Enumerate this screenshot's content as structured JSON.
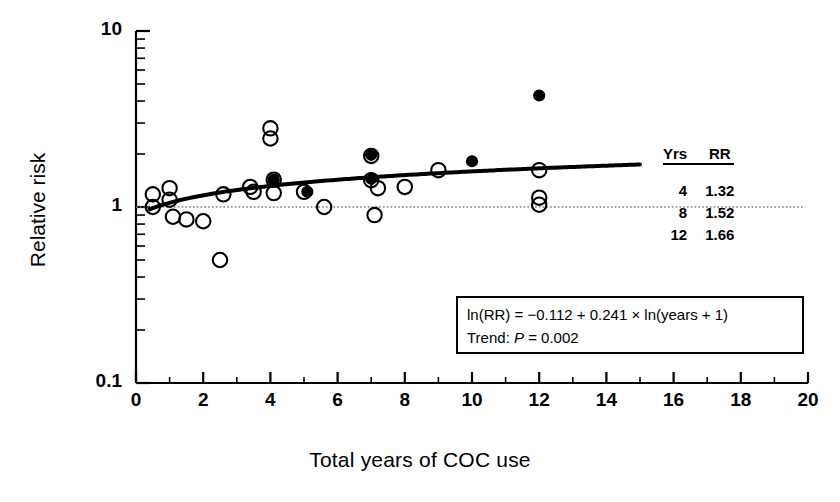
{
  "figure": {
    "title": "",
    "background": "#ffffff",
    "foreground": "#000000"
  },
  "axes": {
    "x_label": "Total years of COC use",
    "y_label": "Relative risk",
    "x_ticks": [
      "0",
      "2",
      "4",
      "6",
      "8",
      "10",
      "12",
      "14",
      "16",
      "18",
      "20"
    ],
    "y_ticks": [
      "10",
      "1",
      "0.1"
    ]
  },
  "legend": {
    "header_yrs": "Yrs",
    "header_rr": "RR",
    "rows": [
      {
        "yrs": "4",
        "rr": "1.32"
      },
      {
        "yrs": "8",
        "rr": "1.52"
      },
      {
        "yrs": "12",
        "rr": "1.66"
      }
    ]
  },
  "equation_box": {
    "line1_pre": "ln(RR) = −0.112 + 0.241 × ln(years + 1)",
    "line2_pre": "Trend: ",
    "line2_italic": "P",
    "line2_post": " = 0.002"
  },
  "chart_data": {
    "type": "scatter",
    "title": "",
    "xlabel": "Total years of COC use",
    "ylabel": "Relative risk",
    "xlim": [
      0,
      20
    ],
    "ylim": [
      0.1,
      10
    ],
    "yscale": "log",
    "grid": false,
    "legend_position": "right",
    "reference_line": {
      "y": 1.0,
      "style": "dotted",
      "color": "#808080"
    },
    "fit_curve": {
      "label": "ln(RR) = −0.112 + 0.241 × ln(years + 1)",
      "intercept": -0.112,
      "slope": 0.241,
      "form": "log",
      "x_range": [
        0.4,
        15.0
      ],
      "style": "solid",
      "width": 4,
      "color": "#000000",
      "p_trend": 0.002,
      "predicted": [
        {
          "years": 4,
          "rr": 1.32
        },
        {
          "years": 8,
          "rr": 1.52
        },
        {
          "years": 12,
          "rr": 1.66
        }
      ]
    },
    "series": [
      {
        "name": "open-circles",
        "marker": "open circle",
        "points": [
          {
            "x": 0.5,
            "y": 1.0
          },
          {
            "x": 0.5,
            "y": 1.18
          },
          {
            "x": 1.0,
            "y": 1.28
          },
          {
            "x": 1.0,
            "y": 1.1
          },
          {
            "x": 1.1,
            "y": 0.88
          },
          {
            "x": 1.5,
            "y": 0.85
          },
          {
            "x": 2.0,
            "y": 0.83
          },
          {
            "x": 2.5,
            "y": 0.5
          },
          {
            "x": 2.6,
            "y": 1.18
          },
          {
            "x": 3.4,
            "y": 1.3
          },
          {
            "x": 3.5,
            "y": 1.22
          },
          {
            "x": 4.0,
            "y": 2.8
          },
          {
            "x": 4.0,
            "y": 2.45
          },
          {
            "x": 4.1,
            "y": 1.43
          },
          {
            "x": 4.1,
            "y": 1.2
          },
          {
            "x": 5.0,
            "y": 1.22
          },
          {
            "x": 5.6,
            "y": 1.0
          },
          {
            "x": 7.0,
            "y": 1.95
          },
          {
            "x": 7.0,
            "y": 1.42
          },
          {
            "x": 7.2,
            "y": 1.28
          },
          {
            "x": 7.1,
            "y": 0.9
          },
          {
            "x": 8.0,
            "y": 1.3
          },
          {
            "x": 9.0,
            "y": 1.62
          },
          {
            "x": 12.0,
            "y": 1.62
          },
          {
            "x": 12.0,
            "y": 1.13
          },
          {
            "x": 12.0,
            "y": 1.03
          }
        ]
      },
      {
        "name": "filled-circles",
        "marker": "filled circle",
        "points": [
          {
            "x": 4.1,
            "y": 1.43
          },
          {
            "x": 5.1,
            "y": 1.22
          },
          {
            "x": 7.0,
            "y": 1.98
          },
          {
            "x": 7.0,
            "y": 1.45
          },
          {
            "x": 10.0,
            "y": 1.82
          },
          {
            "x": 12.0,
            "y": 4.3
          }
        ]
      }
    ]
  }
}
